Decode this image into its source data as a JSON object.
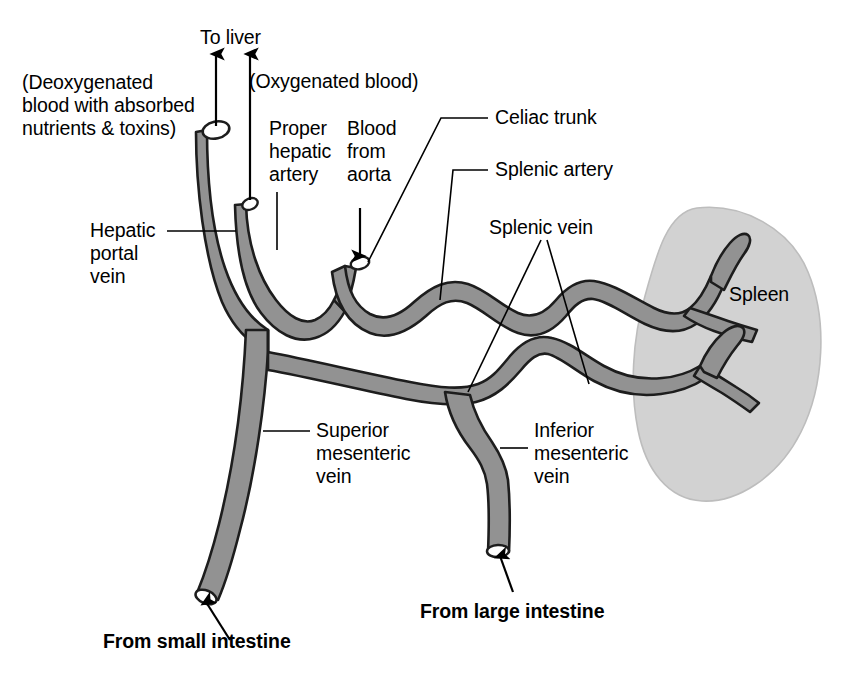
{
  "figure": {
    "colors": {
      "vessel_fill": "#929292",
      "vessel_stroke": "#1a1a1a",
      "spleen_fill": "#d2d2d2",
      "spleen_stroke": "#b4b4b4",
      "leader_line": "#000000",
      "background": "#ffffff",
      "text": "#000000"
    }
  },
  "labels": {
    "to_liver": "To liver",
    "deoxygenated_note": "(Deoxygenated\nblood with absorbed\nnutrients & toxins)",
    "oxygenated_note": "(Oxygenated blood)",
    "proper_hepatic_artery": "Proper\nhepatic\nartery",
    "blood_from_aorta": "Blood\nfrom\naorta",
    "hepatic_portal_vein": "Hepatic\nportal\nvein",
    "celiac_trunk": "Celiac trunk",
    "splenic_artery": "Splenic artery",
    "splenic_vein": "Splenic vein",
    "spleen": "Spleen",
    "superior_mesenteric_vein": "Superior\nmesenteric\nvein",
    "inferior_mesenteric_vein": "Inferior\nmesenteric\nvein",
    "from_small_intestine": "From small intestine",
    "from_large_intestine": "From large intestine"
  },
  "structures": [
    {
      "name": "hepatic-portal-vein",
      "type": "vein",
      "flow": "to liver"
    },
    {
      "name": "proper-hepatic-artery",
      "type": "artery",
      "flow": "to liver"
    },
    {
      "name": "celiac-trunk",
      "type": "artery",
      "flow": "from aorta"
    },
    {
      "name": "splenic-artery",
      "type": "artery",
      "flow": "to spleen"
    },
    {
      "name": "splenic-vein",
      "type": "vein",
      "flow": "from spleen"
    },
    {
      "name": "superior-mesenteric-vein",
      "type": "vein",
      "flow": "from small intestine"
    },
    {
      "name": "inferior-mesenteric-vein",
      "type": "vein",
      "flow": "from large intestine"
    },
    {
      "name": "spleen",
      "type": "organ",
      "flow": ""
    }
  ],
  "arrows": [
    {
      "name": "to-liver-portal-arrow",
      "direction": "up"
    },
    {
      "name": "to-liver-artery-arrow",
      "direction": "up"
    },
    {
      "name": "blood-from-aorta-arrow",
      "direction": "down"
    },
    {
      "name": "from-small-intestine-arrow",
      "direction": "up-left"
    },
    {
      "name": "from-large-intestine-arrow",
      "direction": "up"
    }
  ]
}
